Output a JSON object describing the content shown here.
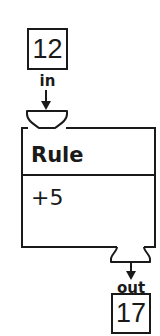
{
  "diagram": {
    "input": {
      "value": "12",
      "label": "in"
    },
    "rule": {
      "title": "Rule",
      "operation": "+5"
    },
    "output": {
      "value": "17",
      "label": "out"
    }
  },
  "icons": {
    "input_arrow": "arrow-down-icon",
    "output_arrow": "arrow-down-icon",
    "input_funnel": "funnel-icon",
    "output_funnel": "funnel-icon"
  },
  "colors": {
    "stroke": "#1a1a1a",
    "background": "#ffffff"
  }
}
